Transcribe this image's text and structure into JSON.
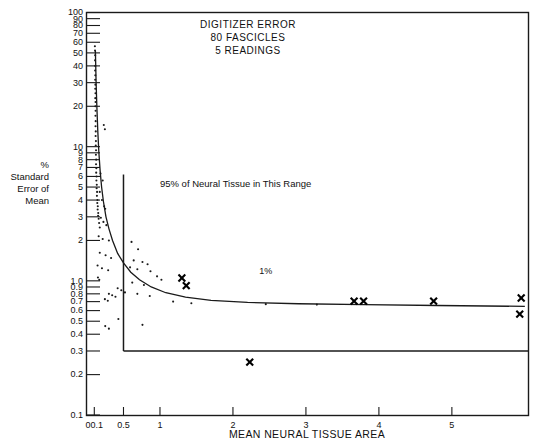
{
  "chart_data": {
    "type": "scatter",
    "title": "DIGITIZER ERROR",
    "title_lines": [
      "DIGITIZER ERROR",
      "80  FASCICLES",
      "5 READINGS"
    ],
    "xlabel": "MEAN NEURAL TISSUE AREA",
    "ylabel": "% Standard Error of Mean",
    "ylabel_lines": [
      "%",
      "Standard",
      "Error of",
      "Mean"
    ],
    "yscale": "log",
    "ylim": [
      0.1,
      100
    ],
    "xlim": [
      0.0,
      6.05
    ],
    "grid": false,
    "legend": null,
    "ytick_labels": [
      "100",
      "90",
      "80",
      "70",
      "60",
      "50",
      "40",
      "30",
      "20",
      "10",
      "9",
      "8",
      "7",
      "6",
      "5",
      "4",
      "3",
      "2",
      "1.0",
      "0.9",
      "0.8",
      "0.7",
      "0.6",
      "0.5",
      "0.4",
      "0.3",
      "0.2",
      "0.1"
    ],
    "ytick_values": [
      100,
      90,
      80,
      70,
      60,
      50,
      40,
      30,
      20,
      10,
      9,
      8,
      7,
      6,
      5,
      4,
      3,
      2,
      1.0,
      0.9,
      0.8,
      0.7,
      0.6,
      0.5,
      0.4,
      0.3,
      0.2,
      0.1
    ],
    "xtick_labels": [
      "00.1",
      "0.5",
      "1",
      "2",
      "3",
      "4",
      "5"
    ],
    "xtick_values": [
      0.1,
      0.5,
      1,
      2,
      3,
      4,
      5
    ],
    "annotations": [
      {
        "text": "95% of Neural Tissue in This Range",
        "x": 1.0,
        "y": 5.0
      },
      {
        "text": "1%",
        "x": 2.45,
        "y": 1.12
      }
    ],
    "reference_lines": [
      {
        "name": "range-boundary-vertical",
        "orientation": "vertical",
        "x": 0.5,
        "y_from": 0.3,
        "y_to": 6.2
      },
      {
        "name": "one-percent-horizontal",
        "orientation": "horizontal",
        "y": 0.3,
        "x_from": 0.5,
        "x_to": 6.05
      }
    ],
    "fit_curve": {
      "name": "error-decay-curve",
      "points": [
        [
          0.115,
          52.0
        ],
        [
          0.125,
          30.0
        ],
        [
          0.135,
          20.0
        ],
        [
          0.148,
          13.0
        ],
        [
          0.163,
          9.0
        ],
        [
          0.18,
          6.6
        ],
        [
          0.2,
          5.0
        ],
        [
          0.225,
          3.9
        ],
        [
          0.26,
          3.0
        ],
        [
          0.3,
          2.45
        ],
        [
          0.35,
          2.0
        ],
        [
          0.42,
          1.6
        ],
        [
          0.5,
          1.36
        ],
        [
          0.6,
          1.16
        ],
        [
          0.72,
          1.02
        ],
        [
          0.88,
          0.9
        ],
        [
          1.08,
          0.815
        ],
        [
          1.35,
          0.755
        ],
        [
          1.7,
          0.715
        ],
        [
          2.2,
          0.69
        ],
        [
          2.9,
          0.675
        ],
        [
          3.8,
          0.665
        ],
        [
          4.8,
          0.655
        ],
        [
          6.0,
          0.645
        ]
      ]
    },
    "series": [
      {
        "name": "fascicle-readings",
        "marker": "dot",
        "points": [
          [
            0.108,
            56.0
          ],
          [
            0.11,
            52.0
          ],
          [
            0.112,
            48.0
          ],
          [
            0.11,
            44.0
          ],
          [
            0.113,
            40.0
          ],
          [
            0.111,
            37.0
          ],
          [
            0.114,
            34.0
          ],
          [
            0.112,
            31.5
          ],
          [
            0.115,
            29.0
          ],
          [
            0.113,
            27.0
          ],
          [
            0.116,
            25.0
          ],
          [
            0.114,
            23.0
          ],
          [
            0.117,
            21.5
          ],
          [
            0.115,
            20.0
          ],
          [
            0.118,
            18.5
          ],
          [
            0.116,
            17.0
          ],
          [
            0.119,
            15.5
          ],
          [
            0.117,
            14.2
          ],
          [
            0.12,
            13.0
          ],
          [
            0.118,
            12.0
          ],
          [
            0.122,
            11.0
          ],
          [
            0.12,
            10.2
          ],
          [
            0.124,
            9.4
          ],
          [
            0.122,
            8.7
          ],
          [
            0.126,
            8.0
          ],
          [
            0.124,
            7.4
          ],
          [
            0.128,
            6.9
          ],
          [
            0.126,
            6.4
          ],
          [
            0.131,
            6.0
          ],
          [
            0.129,
            5.6
          ],
          [
            0.134,
            5.2
          ],
          [
            0.132,
            4.9
          ],
          [
            0.138,
            4.6
          ],
          [
            0.136,
            4.3
          ],
          [
            0.143,
            4.0
          ],
          [
            0.141,
            3.8
          ],
          [
            0.148,
            3.6
          ],
          [
            0.146,
            3.4
          ],
          [
            0.154,
            3.2
          ],
          [
            0.152,
            3.05
          ],
          [
            0.16,
            2.9
          ],
          [
            0.166,
            2.7
          ],
          [
            0.175,
            2.5
          ],
          [
            0.23,
            14.5
          ],
          [
            0.245,
            13.5
          ],
          [
            0.185,
            6.3
          ],
          [
            0.215,
            5.6
          ],
          [
            0.175,
            4.6
          ],
          [
            0.205,
            4.0
          ],
          [
            0.235,
            3.6
          ],
          [
            0.25,
            3.45
          ],
          [
            0.19,
            2.95
          ],
          [
            0.225,
            2.75
          ],
          [
            0.265,
            2.6
          ],
          [
            0.16,
            2.15
          ],
          [
            0.215,
            2.05
          ],
          [
            0.3,
            2.0
          ],
          [
            0.175,
            1.62
          ],
          [
            0.255,
            1.55
          ],
          [
            0.33,
            1.48
          ],
          [
            0.145,
            1.3
          ],
          [
            0.205,
            1.24
          ],
          [
            0.29,
            1.2
          ],
          [
            0.15,
            1.06
          ],
          [
            0.168,
            1.02
          ],
          [
            0.61,
            1.95
          ],
          [
            0.7,
            1.72
          ],
          [
            0.64,
            1.42
          ],
          [
            0.76,
            1.38
          ],
          [
            0.83,
            1.33
          ],
          [
            0.59,
            1.26
          ],
          [
            0.69,
            1.22
          ],
          [
            0.87,
            1.18
          ],
          [
            0.96,
            1.08
          ],
          [
            1.02,
            1.02
          ],
          [
            0.62,
            0.97
          ],
          [
            0.78,
            0.93
          ],
          [
            0.42,
            0.88
          ],
          [
            0.47,
            0.85
          ],
          [
            0.52,
            0.82
          ],
          [
            0.3,
            0.8
          ],
          [
            0.345,
            0.78
          ],
          [
            0.39,
            0.76
          ],
          [
            0.245,
            0.73
          ],
          [
            0.285,
            0.71
          ],
          [
            0.69,
            0.8
          ],
          [
            0.86,
            0.77
          ],
          [
            1.18,
            0.7
          ],
          [
            1.43,
            0.68
          ],
          [
            2.45,
            0.67
          ],
          [
            3.15,
            0.665
          ],
          [
            0.43,
            0.52
          ],
          [
            0.76,
            0.47
          ],
          [
            0.25,
            0.46
          ],
          [
            0.3,
            0.44
          ]
        ]
      },
      {
        "name": "digitizer-error-marks",
        "marker": "x",
        "points": [
          [
            1.3,
            1.05
          ],
          [
            1.36,
            0.92
          ],
          [
            3.66,
            0.705
          ],
          [
            3.79,
            0.705
          ],
          [
            4.75,
            0.705
          ],
          [
            5.95,
            0.745
          ],
          [
            5.93,
            0.565
          ],
          [
            2.23,
            0.248
          ]
        ]
      }
    ]
  }
}
